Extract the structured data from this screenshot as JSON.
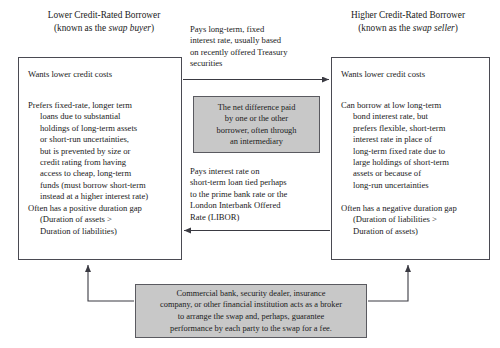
{
  "diagram": {
    "title_left_line1": "Lower Credit-Rated Borrower",
    "title_left_line2_pre": "(known as the ",
    "title_left_line2_em": "swap buyer",
    "title_left_line2_post": ")",
    "title_right_line1": "Higher Credit-Rated Borrower",
    "title_right_line2_pre": "(known as the ",
    "title_right_line2_em": "swap seller",
    "title_right_line2_post": ")"
  },
  "left_party": {
    "goal": "Wants lower credit costs",
    "description": "Prefers fixed-rate, longer term\nloans due to substantial\nholdings of long-term assets\nor short-run uncertainties,\nbut is prevented by size or\ncredit rating from having\naccess to cheap, long-term\nfunds (must borrow short-term\ninstead at a higher interest rate)",
    "duration_gap": "Often has a positive duration gap\n(Duration of assets >\nDuration of liabilities)"
  },
  "right_party": {
    "goal": "Wants lower credit costs",
    "description": "Can borrow at low long-term\nbond interest rate, but\nprefers flexible, short-term\ninterest rate in place of\nlong-term fixed rate due to\nlarge holdings of short-term\nassets or because of\nlong-run uncertainties",
    "duration_gap": "Often has a negative duration gap\n(Duration of liabilities >\nDuration of assets)"
  },
  "flows": {
    "top_flow_label": "Pays long-term, fixed\ninterest rate, usually based\non recently offered Treasury\nsecurities",
    "bottom_flow_label": "Pays interest rate on\nshort-term loan tied perhaps\nto the prime bank rate or the\nLondon Interbank Offered\nRate (LIBOR)",
    "net_difference_note": "The net difference paid\nby one or the other\nborrower, often through\nan intermediary"
  },
  "intermediary": {
    "note": "Commercial bank, security dealer, insurance\ncompany, or other financial institution acts as a broker\nto arrange the swap and, perhaps, guarantee\nperformance by each party to the swap for a fee."
  },
  "colors": {
    "box_border": "#4a4a52",
    "shaded_fill": "#c8c8c8",
    "line": "#3a3a42",
    "text": "#1a1a1a"
  }
}
